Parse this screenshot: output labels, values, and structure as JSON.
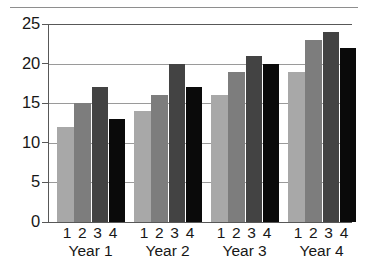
{
  "chart_data": {
    "type": "bar",
    "title": "",
    "subtitle": "",
    "xlabel": "",
    "ylabel": "",
    "categories": [
      "Year 1",
      "Year 2",
      "Year 3",
      "Year 4"
    ],
    "within_group_ticks": [
      "1",
      "2",
      "3",
      "4"
    ],
    "ylim": [
      0,
      25
    ],
    "ytick_values": [
      0,
      5,
      10,
      15,
      20,
      25
    ],
    "ytick_labels": [
      "0",
      "5",
      "10",
      "15",
      "20",
      "25"
    ],
    "grid": true,
    "grid_axis": "y",
    "legend": false,
    "legend_position": "none",
    "series": [
      {
        "name": "1",
        "color": "#a8a8a8",
        "values": [
          12,
          14,
          16,
          19
        ]
      },
      {
        "name": "2",
        "color": "#7d7d7d",
        "values": [
          15,
          16,
          19,
          23
        ]
      },
      {
        "name": "3",
        "color": "#434343",
        "values": [
          17,
          20,
          21,
          24
        ]
      },
      {
        "name": "4",
        "color": "#0a0a0a",
        "values": [
          13,
          17,
          20,
          22
        ]
      }
    ]
  },
  "figure": {
    "bottom_fragment_text": "",
    "axis_color": "#585858",
    "grid_color": "#9a9a9a",
    "top_rule_color": "#8e8e8e",
    "background": "#ffffff"
  }
}
